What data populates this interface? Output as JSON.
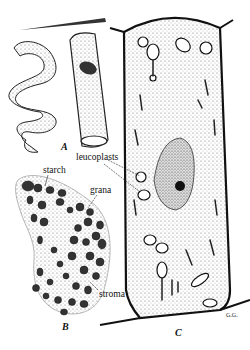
{
  "figure": {
    "panels": [
      {
        "id": "A",
        "label": "A",
        "description": "spiral chloroplast ribbon and cylindrical cell with chloroplast"
      },
      {
        "id": "B",
        "label": "B",
        "description": "chloroplast with grana embedded in stroma"
      },
      {
        "id": "C",
        "label": "C",
        "description": "plant cell with nucleus and leucoplasts"
      }
    ],
    "annotations": {
      "starch": "starch",
      "grana": "grana",
      "stroma": "stroma",
      "leucoplasts": "leucoplasts"
    },
    "signature": "G.G.",
    "colors": {
      "ink": "#111111",
      "background": "#ffffff",
      "stipple": "#555555"
    }
  }
}
